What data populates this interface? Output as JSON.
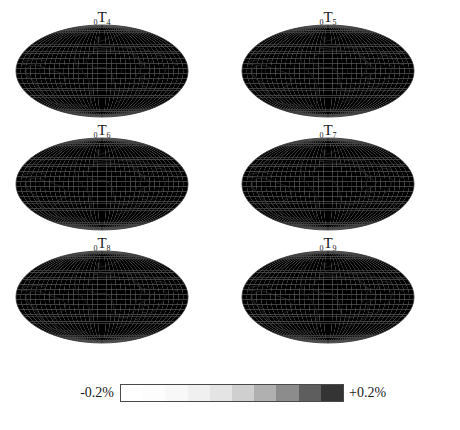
{
  "figure": {
    "projection": "mollweide",
    "panel_count": 6,
    "panels": [
      {
        "id": "panel-0T4",
        "prefix": "0",
        "symbol": "T",
        "suffix": "4",
        "label": "0T4",
        "row": 0,
        "col": 0
      },
      {
        "id": "panel-0T5",
        "prefix": "0",
        "symbol": "T",
        "suffix": "5",
        "label": "0T5",
        "row": 0,
        "col": 1
      },
      {
        "id": "panel-0T6",
        "prefix": "0",
        "symbol": "T",
        "suffix": "6",
        "label": "0T6",
        "row": 1,
        "col": 0
      },
      {
        "id": "panel-0T7",
        "prefix": "0",
        "symbol": "T",
        "suffix": "7",
        "label": "0T7",
        "row": 1,
        "col": 1
      },
      {
        "id": "panel-0T8",
        "prefix": "0",
        "symbol": "T",
        "suffix": "8",
        "label": "0T8",
        "row": 2,
        "col": 0
      },
      {
        "id": "panel-0T9",
        "prefix": "0",
        "symbol": "T",
        "suffix": "9",
        "label": "0T9",
        "row": 2,
        "col": 1
      }
    ]
  },
  "colorbar": {
    "min_label": "-0.2%",
    "max_label": "+0.2%",
    "min_value": -0.2,
    "max_value": 0.2,
    "units": "%",
    "orientation": "horizontal",
    "colors": [
      "#ffffff",
      "#fdfdfd",
      "#f8f8f8",
      "#f0f0f0",
      "#e4e4e4",
      "#cfcfcf",
      "#b0b0b0",
      "#8c8c8c",
      "#5e5e5e",
      "#343434"
    ]
  },
  "chart_data": {
    "type": "heatmap",
    "title": "",
    "xlabel": "",
    "ylabel": "",
    "projection": "mollweide",
    "colorbar_label": "perturbation (%)",
    "colorbar_range": [
      -0.2,
      0.2
    ],
    "legend_position": "bottom",
    "grid": false,
    "series": [
      {
        "name": "0T4",
        "min": -0.2,
        "max": 0.2,
        "seed": 4,
        "degree": 4
      },
      {
        "name": "0T5",
        "min": -0.2,
        "max": 0.2,
        "seed": 5,
        "degree": 5
      },
      {
        "name": "0T6",
        "min": -0.2,
        "max": 0.2,
        "seed": 6,
        "degree": 6
      },
      {
        "name": "0T7",
        "min": -0.2,
        "max": 0.2,
        "seed": 7,
        "degree": 7
      },
      {
        "name": "0T8",
        "min": -0.2,
        "max": 0.2,
        "seed": 8,
        "degree": 8
      },
      {
        "name": "0T9",
        "min": -0.2,
        "max": 0.2,
        "seed": 9,
        "degree": 9
      }
    ]
  }
}
